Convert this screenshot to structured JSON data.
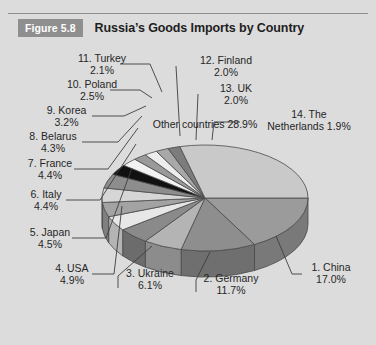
{
  "header": {
    "badge": "Figure 5.8",
    "title": "Russia’s Goods Imports by Country"
  },
  "chart_data": {
    "type": "pie",
    "title": "Russia’s Goods Imports by Country",
    "subtitle": "",
    "xlabel": "",
    "ylabel": "",
    "legend_position": "callout-labels",
    "grid": false,
    "value_unit": "percent",
    "three_d": true,
    "categories": [
      "1. China",
      "2. Germany",
      "3. Ukraine",
      "4. USA",
      "5. Japan",
      "6. Italy",
      "7. France",
      "8. Belarus",
      "9. Korea",
      "10. Poland",
      "11. Turkey",
      "12. Finland",
      "13. UK",
      "14. The Netherlands",
      "Other countries"
    ],
    "values": [
      17.0,
      11.7,
      6.1,
      4.9,
      4.5,
      4.4,
      4.4,
      4.3,
      3.2,
      2.5,
      2.1,
      2.0,
      2.0,
      1.9,
      28.9
    ],
    "slices": [
      {
        "rank": "1.",
        "name": "China",
        "label": "1. China",
        "value": 17.0,
        "value_label": "17.0%",
        "color": "#9b9b9b"
      },
      {
        "rank": "2.",
        "name": "Germany",
        "label": "2. Germany",
        "value": 11.7,
        "value_label": "11.7%",
        "color": "#8e8e8e"
      },
      {
        "rank": "3.",
        "name": "Ukraine",
        "label": "3. Ukraine",
        "value": 6.1,
        "value_label": "6.1%",
        "color": "#b4b4b4"
      },
      {
        "rank": "4.",
        "name": "USA",
        "label": "4. USA",
        "value": 4.9,
        "value_label": "4.9%",
        "color": "#8a8a8a"
      },
      {
        "rank": "5.",
        "name": "Japan",
        "label": "5. Japan",
        "value": 4.5,
        "value_label": "4.5%",
        "color": "#e7e7e7"
      },
      {
        "rank": "6.",
        "name": "Italy",
        "label": "6. Italy",
        "value": 4.4,
        "value_label": "4.4%",
        "color": "#a3a3a3"
      },
      {
        "rank": "7.",
        "name": "France",
        "label": "7. France",
        "value": 4.4,
        "value_label": "4.4%",
        "color": "#d6d6d6"
      },
      {
        "rank": "8.",
        "name": "Belarus",
        "label": "8. Belarus",
        "value": 4.3,
        "value_label": "4.3%",
        "color": "#8d8d8d"
      },
      {
        "rank": "9.",
        "name": "Korea",
        "label": "9. Korea",
        "value": 3.2,
        "value_label": "3.2%",
        "color": "#111111"
      },
      {
        "rank": "10.",
        "name": "Poland",
        "label": "10. Poland",
        "value": 2.5,
        "value_label": "2.5%",
        "color": "#f2f2f2"
      },
      {
        "rank": "11.",
        "name": "Turkey",
        "label": "11. Turkey",
        "value": 2.1,
        "value_label": "2.1%",
        "color": "#9a9a9a"
      },
      {
        "rank": "12.",
        "name": "Finland",
        "label": "12. Finland",
        "value": 2.0,
        "value_label": "2.0%",
        "color": "#ededed"
      },
      {
        "rank": "13.",
        "name": "UK",
        "label": "13. UK",
        "value": 2.0,
        "value_label": "2.0%",
        "color": "#a8a8a8"
      },
      {
        "rank": "14.",
        "name": "The Netherlands",
        "label": "14. The",
        "value": 1.9,
        "value_label": "Netherlands 1.9%",
        "color": "#7c7c7c"
      },
      {
        "rank": "",
        "name": "Other countries",
        "label": "Other countries",
        "value": 28.9,
        "value_label": "28.9%",
        "color": "#c9c9c9"
      }
    ],
    "colors": {
      "background": "#dcdcdc",
      "badge": "#8f8f8f",
      "text": "#262626",
      "rule": "#8e8e8e",
      "outline": "#4a4a4a"
    }
  }
}
